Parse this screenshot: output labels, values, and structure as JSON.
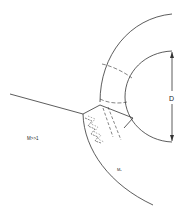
{
  "diagram": {
    "type": "schematic",
    "labels": {
      "mach": "M>>1",
      "diameter": "D",
      "region": "M₁"
    },
    "colors": {
      "line": "#333333",
      "background": "#ffffff"
    }
  }
}
